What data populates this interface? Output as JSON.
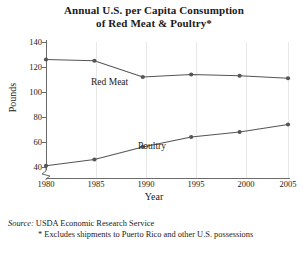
{
  "chart_data": {
    "type": "line",
    "title": "Annual U.S. per Capita Consumption of Red Meat & Poultry*",
    "title_line1": "Annual U.S. per Capita Consumption",
    "title_line2": "of Red Meat & Poultry*",
    "xlabel": "Year",
    "ylabel": "Pounds",
    "x": [
      1980,
      1985,
      1990,
      1995,
      2000,
      2005
    ],
    "xtick_labels": [
      "1980",
      "1985",
      "1990",
      "1995",
      "2000",
      "2005"
    ],
    "ytick_labels": [
      "140",
      "120",
      "100",
      "80",
      "60",
      "40"
    ],
    "ytick_values": [
      140,
      120,
      100,
      80,
      60,
      40
    ],
    "ylim": [
      40,
      140
    ],
    "xlim": [
      1980,
      2005
    ],
    "y_axis_break": true,
    "grid": "vertical-only",
    "legend": "inline-labels",
    "series": [
      {
        "name": "Red Meat",
        "label": "Red Meat",
        "color": "#555555",
        "values": [
          126,
          125,
          112,
          114,
          113,
          111
        ]
      },
      {
        "name": "Poultry",
        "label": "Poultry",
        "color": "#555555",
        "values": [
          41,
          46,
          56,
          64,
          68,
          74
        ]
      }
    ]
  },
  "notes": {
    "source_word": "Source:",
    "source_text": "USDA Economic Research Service",
    "footnote": "* Excludes shipments to Puerto Rico and other U.S. possessions"
  },
  "colors": {
    "line": "#555555",
    "axis": "#6b6b6b",
    "grid": "#e8e8e8",
    "text": "#1a1a1a",
    "background": "#ffffff"
  }
}
